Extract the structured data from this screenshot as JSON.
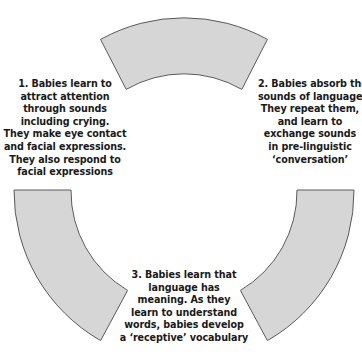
{
  "diagram": {
    "type": "cycle",
    "colors": {
      "segment_fill": "#d6d6d6",
      "segment_stroke": "#5a5a5a",
      "text": "#1a1a1a"
    },
    "segments": [
      {
        "position": "top",
        "label": ""
      },
      {
        "position": "bottom-left",
        "label": ""
      },
      {
        "position": "bottom-right",
        "label": ""
      }
    ],
    "steps": [
      {
        "number": "1",
        "lines": [
          "1. Babies learn to",
          "attract attention",
          "through sounds",
          "including crying.",
          "They make eye contact",
          "and facial expressions.",
          "They also respond to",
          "facial expressions"
        ]
      },
      {
        "number": "2",
        "lines": [
          "2. Babies absorb the",
          "sounds of language.",
          "They repeat them,",
          "and learn to",
          "exchange sounds",
          "in pre-linguistic",
          "‘conversation’"
        ]
      },
      {
        "number": "3",
        "lines": [
          "3. Babies learn that",
          "language has",
          "meaning. As they",
          "learn to understand",
          "words, babies develop",
          "a ‘receptive’ vocabulary"
        ]
      }
    ]
  }
}
